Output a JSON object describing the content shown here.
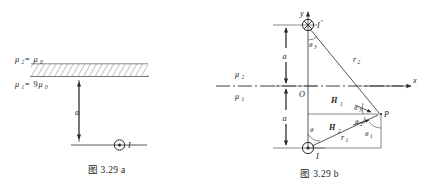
{
  "document": {
    "type": "physics-textbook-figure",
    "description": "Two-part figure showing a line current near a planar interface between two magnetic media, and its image-current construction."
  },
  "figure_a": {
    "caption": "图 3.29 a",
    "labels": {
      "mu_upper": "μ",
      "mu_upper_sub": "2",
      "mu_upper_eq": "= μ",
      "mu_upper_val_sub": "0",
      "mu_lower": "μ",
      "mu_lower_sub": "1",
      "mu_lower_eq": "= 9μ",
      "mu_lower_val_sub": "0",
      "distance": "a",
      "current": "I"
    },
    "icons": {
      "current_out_of_page": "dot-in-circle-icon",
      "hatched_region": "hatch-fill-icon"
    }
  },
  "figure_b": {
    "caption": "图 3.29 b",
    "axes": {
      "x_label": "x",
      "y_label": "y",
      "origin_label": "O"
    },
    "media": {
      "upper": "μ",
      "upper_sub": "2",
      "lower": "μ",
      "lower_sub": "1"
    },
    "distances": {
      "upper": "a",
      "lower": "a"
    },
    "currents": [
      {
        "name": "image-current",
        "label": "I",
        "prime": "′",
        "icon": "cross-in-circle-icon",
        "direction": "into-page"
      },
      {
        "name": "source-current",
        "label": "I",
        "prime": "",
        "icon": "dot-in-circle-icon",
        "direction": "out-of-page"
      }
    ],
    "field_vectors": [
      {
        "name": "H-one",
        "label": "H",
        "sub": "1"
      },
      {
        "name": "H-two",
        "label": "H",
        "sub": "2"
      }
    ],
    "radii": [
      {
        "name": "r-one",
        "label": "r",
        "sub": "1"
      },
      {
        "name": "r-two",
        "label": "r",
        "sub": "2"
      }
    ],
    "angles": [
      {
        "name": "theta",
        "label": "θ",
        "sub": ""
      },
      {
        "name": "theta-one",
        "label": "θ",
        "sub": "1"
      },
      {
        "name": "theta-two",
        "label": "θ",
        "sub": "2"
      },
      {
        "name": "theta-three-top",
        "label": "θ",
        "sub": "3"
      },
      {
        "name": "theta-three-p",
        "label": "θ",
        "sub": "3"
      }
    ],
    "point_label": "P"
  }
}
